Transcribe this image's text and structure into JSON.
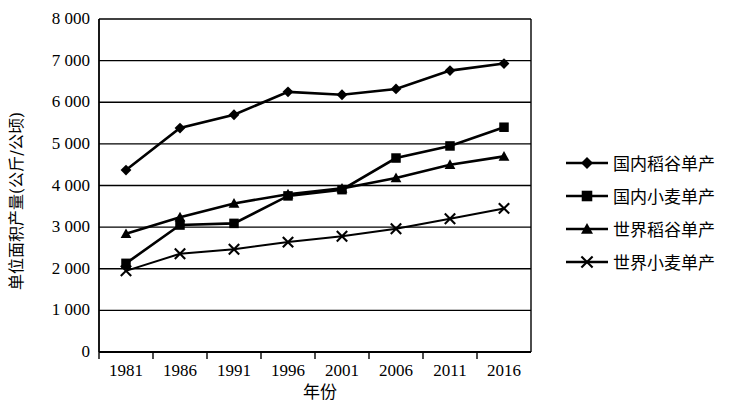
{
  "chart_data": {
    "type": "line",
    "title": "",
    "xlabel": "年份",
    "ylabel": "单位面积产量(公斤/公顷)",
    "categories": [
      "1981",
      "1986",
      "1991",
      "1996",
      "2001",
      "2006",
      "2011",
      "2016"
    ],
    "x_ticks": [
      "1981",
      "1986",
      "1991",
      "1996",
      "2001",
      "2006",
      "2011",
      "2016"
    ],
    "y_ticks": [
      "0",
      "1 000",
      "2 000",
      "3 000",
      "4 000",
      "5 000",
      "6 000",
      "7 000",
      "8 000"
    ],
    "y_tick_values": [
      0,
      1000,
      2000,
      3000,
      4000,
      5000,
      6000,
      7000,
      8000
    ],
    "ylim": [
      0,
      8000
    ],
    "grid": "horizontal",
    "legend_position": "right",
    "series": [
      {
        "name": "国内稻谷单产",
        "marker": "diamond",
        "values": [
          4370,
          5380,
          5700,
          6250,
          6180,
          6320,
          6760,
          6930
        ]
      },
      {
        "name": "国内小麦单产",
        "marker": "square",
        "values": [
          2130,
          3050,
          3090,
          3750,
          3900,
          4660,
          4950,
          5400
        ]
      },
      {
        "name": "世界稻谷单产",
        "marker": "triangle",
        "values": [
          2840,
          3240,
          3570,
          3790,
          3930,
          4180,
          4500,
          4700
        ]
      },
      {
        "name": "世界小麦单产",
        "marker": "x",
        "values": [
          1950,
          2360,
          2470,
          2640,
          2780,
          2960,
          3200,
          3450
        ]
      }
    ]
  }
}
